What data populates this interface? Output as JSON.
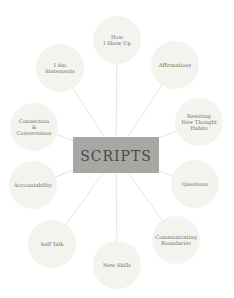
{
  "diagram": {
    "center": {
      "label": "SCRIPTS"
    },
    "nodes": [
      {
        "id": "how-i-show-up",
        "lines": [
          "How",
          "I Show Up"
        ]
      },
      {
        "id": "affirmations",
        "lines": [
          "Affirmations"
        ]
      },
      {
        "id": "rewiring-new-thought-habits",
        "lines": [
          "Rewiring",
          "New Thought",
          "Habits"
        ]
      },
      {
        "id": "questions",
        "lines": [
          "Questions"
        ]
      },
      {
        "id": "communicating-boundaries",
        "lines": [
          "Communicating",
          "Boundaries"
        ]
      },
      {
        "id": "new-skills",
        "lines": [
          "New Skills"
        ]
      },
      {
        "id": "self-talk",
        "lines": [
          "Self Talk"
        ]
      },
      {
        "id": "accountability",
        "lines": [
          "Accountability"
        ]
      },
      {
        "id": "connection-conversation",
        "lines": [
          "Connection",
          "&",
          "Conversation"
        ]
      },
      {
        "id": "i-am-statements",
        "lines": [
          "I Am",
          "Statements"
        ]
      }
    ],
    "colors": {
      "center_fill": "#a7a7a3",
      "center_text": "#4a4a48",
      "node_fill": "#f4f4ee",
      "connector": "#c9c9c4",
      "node_text": "#6b6b66"
    }
  }
}
